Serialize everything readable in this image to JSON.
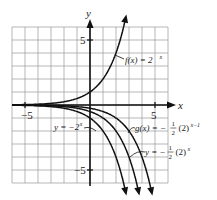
{
  "chart_data": {
    "type": "line",
    "title": "",
    "xlabel": "x",
    "ylabel": "y",
    "xlim": [
      -6,
      6
    ],
    "ylim": [
      -6,
      6
    ],
    "grid": true,
    "x_ticks": [
      {
        "value": -5,
        "label": "−5"
      },
      {
        "value": 5,
        "label": "5"
      }
    ],
    "y_ticks": [
      {
        "value": 5,
        "label": "5"
      },
      {
        "value": -5,
        "label": "−5"
      }
    ],
    "series": [
      {
        "name": "f(x) = 2^x",
        "label": "f(x) = 2",
        "sup": "x",
        "expr": "2^x",
        "coef": 1,
        "shift": 0
      },
      {
        "name": "y = -2^x",
        "label": "y = −2",
        "sup": "x",
        "expr": "-2^x",
        "coef": -1,
        "shift": 0
      },
      {
        "name": "g(x) = -1/2 (2)^(x-1)",
        "label": "g(x) = −",
        "frac": "1/2",
        "tail": "(2)",
        "sup": "x−1",
        "expr": "-0.5*2^(x-1)",
        "coef": -0.5,
        "shift": 1
      },
      {
        "name": "y = -1/2 (2)^x",
        "label": "y = −",
        "frac": "1/2",
        "tail": "(2)",
        "sup": "x",
        "expr": "-0.5*2^x",
        "coef": -0.5,
        "shift": 0
      }
    ]
  }
}
